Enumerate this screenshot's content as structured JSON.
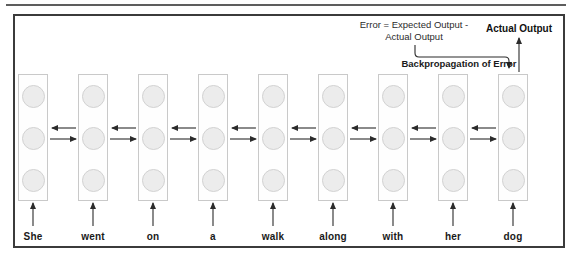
{
  "figure": {
    "title_labels": {
      "error_formula": "Error = Expected Output - Actual Output",
      "error_formula_line1": "Error = Expected Output -",
      "error_formula_line2": "Actual Output",
      "backpropagation": "Backpropagation of Error",
      "actual_output": "Actual Output"
    },
    "colors": {
      "frame_border": "#3b3b3b",
      "top_rule": "#5d5d5d",
      "cell_border": "#c9c9c9",
      "node_fill": "#ececec",
      "node_border": "#d2d2d2",
      "arrow": "#2b2b2b",
      "text": "#1a1a1a",
      "background": "#ffffff"
    },
    "timesteps": [
      {
        "word": "She",
        "x": 18,
        "nodes": 3
      },
      {
        "word": "went",
        "x": 78,
        "nodes": 3
      },
      {
        "word": "on",
        "x": 138,
        "nodes": 3
      },
      {
        "word": "a",
        "x": 198,
        "nodes": 3
      },
      {
        "word": "walk",
        "x": 258,
        "nodes": 3
      },
      {
        "word": "along",
        "x": 318,
        "nodes": 3
      },
      {
        "word": "with",
        "x": 378,
        "nodes": 3
      },
      {
        "word": "her",
        "x": 438,
        "nodes": 3
      },
      {
        "word": "dog",
        "x": 498,
        "nodes": 3
      }
    ],
    "sentence": "She went on a walk along with her dog",
    "node_count_per_cell": 3,
    "timestep_count": 9,
    "icons": {
      "input_arrow": "arrow-up-icon",
      "output_arrow": "arrow-up-icon",
      "backprop_arrow": "arrow-down-icon",
      "forward_arrow": "arrow-right-icon",
      "backward_arrow": "arrow-left-icon"
    }
  }
}
